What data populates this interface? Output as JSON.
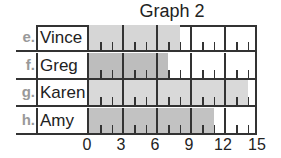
{
  "chart_data": {
    "type": "bar",
    "orientation": "horizontal",
    "title": "Graph 2",
    "categories": [
      "Vince",
      "Greg",
      "Karen",
      "Amy"
    ],
    "row_letters": [
      "e.",
      "f.",
      "g.",
      "h."
    ],
    "values": [
      8,
      7,
      14,
      11
    ],
    "xlabel": "",
    "ylabel": "",
    "xlim": [
      0,
      15
    ],
    "xticks": [
      0,
      3,
      6,
      9,
      12,
      15
    ],
    "minor_ticks_per_interval": 2,
    "grid": true,
    "bar_colors": [
      "#d6d6d6",
      "#bdbdbd",
      "#d9d9d9",
      "#c2c2c2"
    ]
  }
}
